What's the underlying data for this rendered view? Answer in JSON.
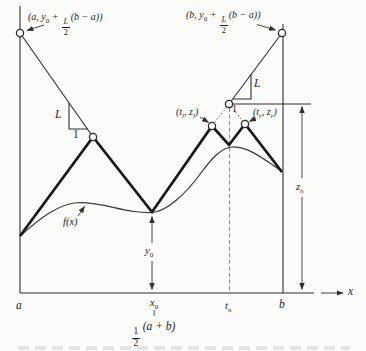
{
  "figure": {
    "upper_left_point_label": {
      "pre": "(a, y",
      "sub": "0",
      "mid": " + ",
      "frac_num": "L",
      "frac_den": "2",
      "post": "(b − a))"
    },
    "upper_right_point_label": {
      "pre": "(b, y",
      "sub": "0",
      "mid": " + ",
      "frac_num": "L",
      "frac_den": "2",
      "post": "(b − a))"
    },
    "left_slope_triangle": {
      "rise": "L",
      "run": "1"
    },
    "right_slope_triangle": {
      "rise": "L",
      "run": "1"
    },
    "left_candidate_label": {
      "pre": "(t",
      "sub1": "l",
      "mid": ", z",
      "sub2": "l",
      "post": ")"
    },
    "right_candidate_label": {
      "pre": "(t",
      "sub1": "r",
      "mid": ", z",
      "sub2": "r",
      "post": ")"
    },
    "curve_label": "f(x)",
    "y0_dimension": {
      "base": "y",
      "sub": "0"
    },
    "zn_dimension": {
      "base": "z",
      "sub": "n"
    }
  },
  "axis": {
    "a": "a",
    "x0": {
      "base": "x",
      "sub": "0"
    },
    "equals_mark": "‖",
    "x0_value": {
      "frac_num": "1",
      "frac_den": "2",
      "expr": "(a + b)"
    },
    "tn": {
      "base": "t",
      "sub": "n"
    },
    "b": "b",
    "x": "x"
  }
}
